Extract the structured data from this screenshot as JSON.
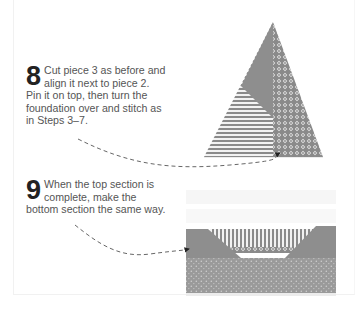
{
  "steps": [
    {
      "number": "8",
      "text": "Cut piece 3 as before and align it next to piece 2. Pin it on top, then turn the foundation over and stitch as in Steps 3–7."
    },
    {
      "number": "9",
      "text": "When the top section is complete, make the bottom section the same way."
    }
  ],
  "illustrations": {
    "top": "triangle-block-illustration",
    "bottom": "bottom-section-block-illustration"
  },
  "colors": {
    "fabric_gray": "#8e8e8e",
    "fabric_dark": "#7a7a7a",
    "text": "#555555",
    "number": "#222222"
  }
}
